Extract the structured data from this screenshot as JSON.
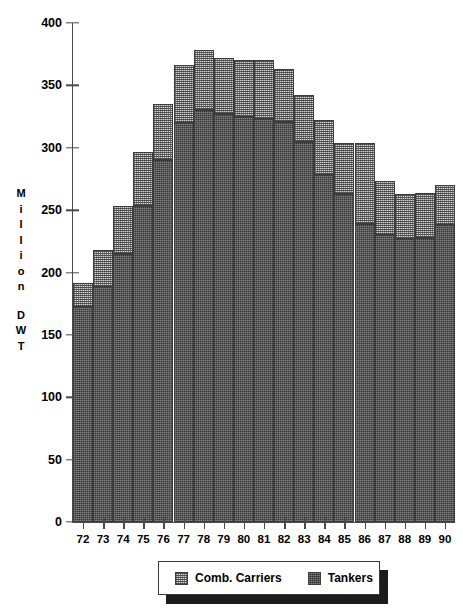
{
  "chart_data": {
    "type": "bar",
    "stacked": true,
    "title": "",
    "xlabel": "",
    "ylabel": "Million DWT",
    "ylim": [
      0,
      400
    ],
    "ytick_step": 50,
    "ytick_labels": [
      "400",
      "350",
      "300",
      "250",
      "200",
      "150",
      "100",
      "50",
      "0"
    ],
    "ytick_values": [
      400,
      350,
      300,
      250,
      200,
      150,
      100,
      50,
      0
    ],
    "grid": false,
    "legend_position": "bottom",
    "categories": [
      "72",
      "73",
      "74",
      "75",
      "76",
      "77",
      "78",
      "79",
      "80",
      "81",
      "82",
      "83",
      "84",
      "85",
      "86",
      "87",
      "88",
      "89",
      "90"
    ],
    "series": [
      {
        "name": "Tankers",
        "color": "#343434",
        "pattern": "dark-dense",
        "values": [
          172,
          188,
          215,
          253,
          290,
          320,
          330,
          327,
          325,
          323,
          321,
          305,
          278,
          263,
          239,
          230,
          227,
          228,
          238
        ]
      },
      {
        "name": "Comb. Carriers",
        "color": "#d8d8d8",
        "pattern": "checker-light",
        "values": [
          20,
          30,
          38,
          44,
          45,
          46,
          48,
          45,
          45,
          47,
          42,
          37,
          44,
          41,
          65,
          43,
          36,
          36,
          32
        ]
      }
    ],
    "totals": [
      192,
      218,
      253,
      297,
      335,
      366,
      378,
      372,
      370,
      370,
      363,
      342,
      322,
      304,
      304,
      273,
      263,
      264,
      270
    ]
  },
  "y_axis": {
    "label_letters": [
      "M",
      "i",
      "l",
      "l",
      "i",
      "o",
      "n",
      "",
      "D",
      "W",
      "T"
    ]
  },
  "legend": {
    "items": [
      {
        "label": "Comb. Carriers",
        "swatch": "comb-carriers-swatch"
      },
      {
        "label": "Tankers",
        "swatch": "tankers-swatch"
      }
    ]
  }
}
